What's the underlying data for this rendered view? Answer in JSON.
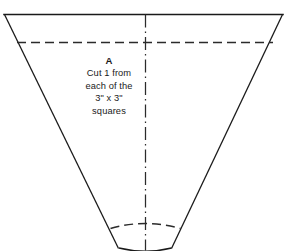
{
  "figure": {
    "name": "quilt-pattern-piece-a",
    "background_color": "#ffffff",
    "line_color": "#1a1a1a",
    "width": 286,
    "height": 251
  },
  "label": {
    "title": "A",
    "lines": [
      "Cut 1 from",
      "each of the",
      "3\" x 3\"",
      "squares"
    ]
  },
  "geometry": {
    "top_edge": "M 4 14.5 L 283 14.5",
    "left_edge": "M 4.5 14.5 L 118.5 248.5",
    "right_edge": "M 282.5 14.5 L 171.5 248.5",
    "seam_line_dashed": "M 17 42.5 L 273 42.5",
    "center_line": "M 145.5 14.5 L 145.5 250.5",
    "bottom_arc_dashed": "M 110.5 228.5 Q 145.5 218.5 180.5 228.5",
    "bottom_arc_solid": "M 119 248 Q 145.5 254.5 171.5 248"
  },
  "icons": {
    "center_line": "center-line-dash-dot",
    "seam_line": "seam-allowance-dashed-line"
  }
}
